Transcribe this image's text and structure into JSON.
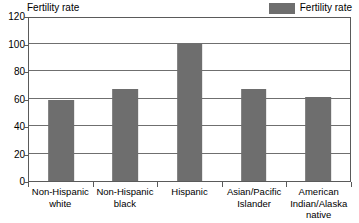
{
  "axis_title": "Fertility rate",
  "legend": {
    "position": "top-right",
    "entries": [
      {
        "label": "Fertility rate",
        "color": "#6e6e6e",
        "swatch_icon": "legend-swatch-icon"
      }
    ]
  },
  "colors": {
    "bar": "#6e6e6e",
    "gridline": "#6f6f6f",
    "frame": "#5a5a5a",
    "background": "#ffffff",
    "text": "#000000"
  },
  "chart_data": {
    "type": "bar",
    "title": "Fertility rate",
    "xlabel": "",
    "ylabel": "Fertility rate",
    "ylim": [
      0,
      120
    ],
    "yticks": [
      0,
      20,
      40,
      60,
      80,
      100,
      120
    ],
    "ytick_labels": [
      "0",
      "20",
      "40",
      "60",
      "80",
      "100",
      "120"
    ],
    "grid": true,
    "grid_axis": "y",
    "legend_position": "top-right",
    "categories": [
      "Non-Hispanic white",
      "Non-Hispanic black",
      "Hispanic",
      "Asian/Pacific Islander",
      "American Indian/Alaska native"
    ],
    "category_lines": [
      [
        "Non-Hispanic",
        "white"
      ],
      [
        "Non-Hispanic",
        "black"
      ],
      [
        "Hispanic"
      ],
      [
        "Asian/Pacific",
        "Islander"
      ],
      [
        "American",
        "Indian/Alaska",
        "native"
      ]
    ],
    "series": [
      {
        "name": "Fertility rate",
        "color": "#6e6e6e",
        "values": [
          59,
          67,
          100,
          67,
          61
        ]
      }
    ]
  }
}
